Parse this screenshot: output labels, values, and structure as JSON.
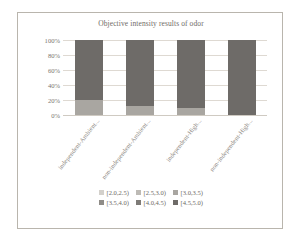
{
  "chart_data": {
    "type": "bar",
    "subtype": "stacked-100-percent",
    "title": "Objective intensity results of odor",
    "xlabel": "",
    "ylabel": "",
    "ylim": [
      0,
      100
    ],
    "ytick_labels": [
      "100%",
      "80%",
      "60%",
      "40%",
      "20%",
      "0%"
    ],
    "ytick_values": [
      100,
      80,
      60,
      40,
      20,
      0
    ],
    "grid": true,
    "legend_position": "bottom",
    "categories": [
      "independent-Ambient...",
      "non-independent-Ambient...",
      "independent-High...",
      "non-independent-High..."
    ],
    "series": [
      {
        "name": "[2.0,2.5)",
        "color": "#d3d0cb",
        "values": [
          0,
          0,
          0,
          0
        ]
      },
      {
        "name": "[2.5,3.0)",
        "color": "#bdbab5",
        "values": [
          0,
          0,
          0,
          0
        ]
      },
      {
        "name": "[3.0,3.5)",
        "color": "#a9a6a1",
        "values": [
          20,
          12,
          10,
          0
        ]
      },
      {
        "name": "[3.5,4.0)",
        "color": "#8f8c87",
        "values": [
          0,
          0,
          0,
          0
        ]
      },
      {
        "name": "[4.0,4.5)",
        "color": "#7e7b77",
        "values": [
          0,
          0,
          0,
          0
        ]
      },
      {
        "name": "[4.5,5.0)",
        "color": "#6e6b68",
        "values": [
          80,
          88,
          90,
          100
        ]
      }
    ]
  },
  "legend": {
    "row1": [
      {
        "label": "[2.0,2.5)",
        "color": "#d3d0cb"
      },
      {
        "label": "[2.5,3.0)",
        "color": "#bdbab5"
      },
      {
        "label": "[3.0,3.5)",
        "color": "#a9a6a1"
      }
    ],
    "row2": [
      {
        "label": "[3.5,4.0)",
        "color": "#8f8c87"
      },
      {
        "label": "[4.0,4.5)",
        "color": "#7e7b77"
      },
      {
        "label": "[4.5,5.0)",
        "color": "#6e6b68"
      }
    ]
  }
}
